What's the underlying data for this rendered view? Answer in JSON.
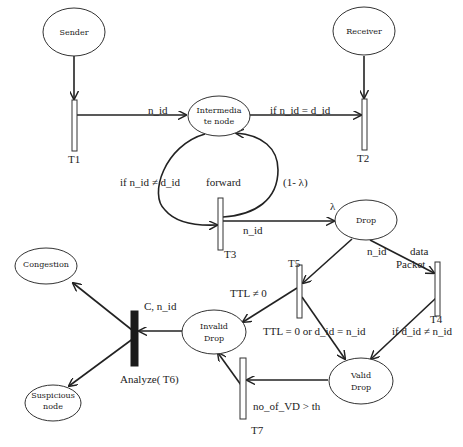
{
  "diagram": {
    "type": "petri-net",
    "places": {
      "sender": [
        "Sender"
      ],
      "receiver": [
        "Receiver"
      ],
      "intermediate": [
        "Intermedia",
        "te node"
      ],
      "drop": [
        "Drop"
      ],
      "invalid_drop": [
        "Invalid",
        "Drop"
      ],
      "valid_drop": [
        "Valid",
        "Drop"
      ],
      "congestion": [
        "Congestion"
      ],
      "suspicious": [
        "Suspicious",
        "node"
      ]
    },
    "transitions": {
      "t1": "T1",
      "t2": "T2",
      "t3": "T3",
      "t4": "T4",
      "t5": "T5",
      "t6": "Analyze( T6)",
      "t7": "T7"
    },
    "edge_labels": {
      "t1_to_intermediate": "n_id",
      "intermediate_to_t2": "if n_id = d_id",
      "intermediate_to_t3": "if  n_id ≠ d_id",
      "forward": "forward",
      "t3_to_intermediate": "(1- λ)",
      "t3_to_drop": "n_id",
      "lambda": "λ",
      "drop_to_t4_a": "n_id",
      "drop_to_t4_b": "data",
      "drop_to_t4_c": "Packet",
      "t5_to_invalid": "TTL ≠ 0",
      "t5_to_valid": "TTL = 0 or d_id = n_id",
      "t4_to_valid": "if d_id ≠ n_id",
      "invalid_to_t6": "C, n_id",
      "valid_to_t7": "no_of_VD > th"
    }
  }
}
